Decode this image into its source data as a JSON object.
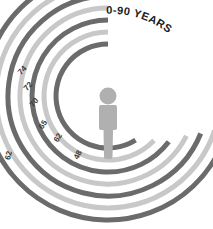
{
  "chart_data": {
    "type": "pie",
    "subtype": "radial-arc-rings",
    "title": "0-90 YEARS",
    "xlabel": "",
    "ylabel": "",
    "units": "years",
    "range_min": 0,
    "range_max": 90,
    "start_angle_deg": 0,
    "direction": "counter-clockwise",
    "grid": false,
    "legend": false,
    "legend_position": "none",
    "center_icon": "person-icon",
    "categories": [
      "48",
      "62",
      "65",
      "70",
      "72",
      "74",
      "62"
    ],
    "values": [
      48,
      62,
      65,
      70,
      72,
      74,
      62
    ],
    "series": [
      {
        "name": "age rings",
        "values": [
          48,
          62,
          65,
          70,
          72,
          74,
          62
        ]
      }
    ],
    "rings": [
      {
        "index": 0,
        "label": "48",
        "value": 48,
        "radius": 52,
        "color": "#6b6b6b",
        "sweep_deg": 212,
        "label_x": 80,
        "label_y": 156,
        "label_rot": -62
      },
      {
        "index": 1,
        "label": "62",
        "value": 62,
        "radius": 64,
        "color": "#c8c8c8",
        "sweep_deg": 226,
        "label_x": 60,
        "label_y": 139,
        "label_rot": -58
      },
      {
        "index": 2,
        "label": "65",
        "value": 65,
        "radius": 76,
        "color": "#6b6b6b",
        "sweep_deg": 233,
        "label_x": 45,
        "label_y": 126,
        "label_rot": -55
      },
      {
        "index": 3,
        "label": "70",
        "value": 70,
        "radius": 88,
        "color": "#c8c8c8",
        "sweep_deg": 243,
        "label_x": 36,
        "label_y": 104,
        "label_rot": -50
      },
      {
        "index": 4,
        "label": "72",
        "value": 72,
        "radius": 100,
        "color": "#6b6b6b",
        "sweep_deg": 248,
        "label_x": 30,
        "label_y": 88,
        "label_rot": -48
      },
      {
        "index": 5,
        "label": "74",
        "value": 74,
        "radius": 112,
        "color": "#c8c8c8",
        "sweep_deg": 252,
        "label_x": 24,
        "label_y": 72,
        "label_rot": -46
      },
      {
        "index": 6,
        "label": "62",
        "value": 62,
        "radius": 124,
        "color": "#6b6b6b",
        "sweep_deg": 268,
        "label_x": 11,
        "label_y": 156,
        "label_rot": -78
      }
    ],
    "colors": {
      "arc_dark": "#6b6b6b",
      "arc_light": "#c8c8c8",
      "label_text": "#3a3a3a",
      "title_text": "#1c1c1c",
      "center_figure": "#b0b0b0",
      "background": "#ffffff"
    }
  }
}
